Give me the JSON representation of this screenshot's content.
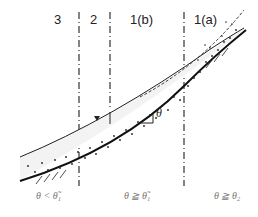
{
  "diagram": {
    "zones": [
      {
        "id": "zone-3",
        "label": "3"
      },
      {
        "id": "zone-2",
        "label": "2"
      },
      {
        "id": "zone-1b",
        "label": "1(b)"
      },
      {
        "id": "zone-1a",
        "label": "1(a)"
      }
    ],
    "conditions": [
      {
        "label": "θ < θ̃₁"
      },
      {
        "label": "θ ≧ θ̃₁"
      },
      {
        "label": "θ ≧ θ₂"
      }
    ],
    "angle_label": "θ",
    "colors": {
      "line": "#1a1a1a",
      "dash": "#333333",
      "stipple": "#222222"
    }
  }
}
